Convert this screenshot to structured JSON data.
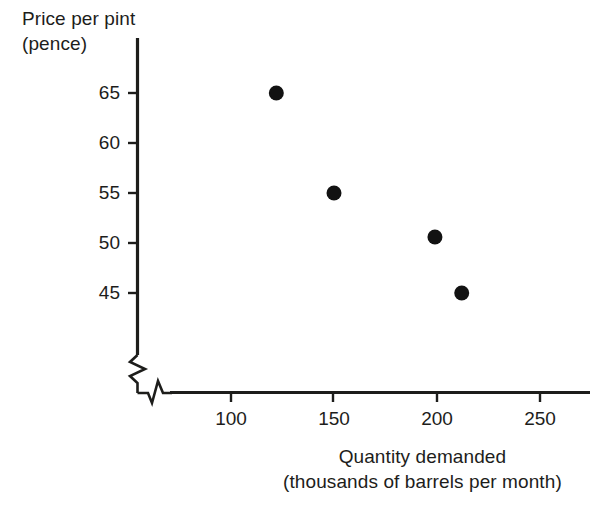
{
  "chart_data": {
    "type": "scatter",
    "title": "",
    "xlabel": "Quantity demanded (thousands of barrels per month)",
    "ylabel": "Price per pint (pence)",
    "xlabel_line1": "Quantity demanded",
    "xlabel_line2": "(thousands of barrels per month)",
    "ylabel_line1": "Price per pint",
    "ylabel_line2": "(pence)",
    "x_ticks": [
      100,
      150,
      200,
      250
    ],
    "y_ticks": [
      45,
      50,
      55,
      60,
      65
    ],
    "x_tick_labels": [
      "100",
      "150",
      "200",
      "250"
    ],
    "y_tick_labels": [
      "45",
      "50",
      "55",
      "60",
      "65"
    ],
    "xlim": [
      75,
      270
    ],
    "ylim": [
      42,
      67
    ],
    "grid": false,
    "legend": null,
    "axis_break_x": true,
    "axis_break_y": true,
    "point_color": "#121212",
    "axis_color": "#1d1d1b",
    "background": "#ffffff",
    "points": [
      {
        "x": 122,
        "y": 65.0
      },
      {
        "x": 150,
        "y": 55.0
      },
      {
        "x": 199,
        "y": 50.6
      },
      {
        "x": 212,
        "y": 45.0
      }
    ],
    "series": [
      {
        "name": "Demand observations",
        "x": [
          122,
          150,
          199,
          212
        ],
        "values": [
          65.0,
          55.0,
          50.6,
          45.0
        ]
      }
    ]
  }
}
